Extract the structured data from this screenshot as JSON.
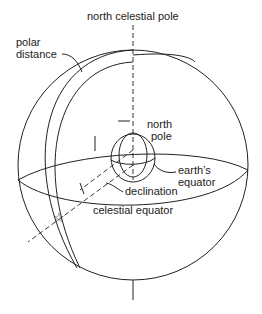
{
  "diagram": {
    "labels": {
      "north_celestial_pole": "north celestial pole",
      "polar_distance_1": "polar",
      "polar_distance_2": "distance",
      "north_pole_1": "north",
      "north_pole_2": "pole",
      "earths_equator_1": "earth’s",
      "earths_equator_2": "equator",
      "declination": "declination",
      "celestial_equator": "celestial equator"
    },
    "colors": {
      "stroke": "#222222",
      "background": "#ffffff"
    }
  }
}
